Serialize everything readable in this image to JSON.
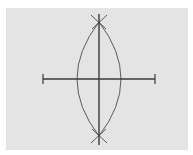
{
  "diagram": {
    "colors": {
      "background": "#ffffff",
      "panel": "#e4e4e4",
      "line": "#3a3a3a",
      "arc": "#5a5a5a"
    },
    "segment": {
      "x1": 43,
      "y1": 79,
      "x2": 155,
      "y2": 79
    },
    "bisector": {
      "x1": 99,
      "y1": 14,
      "x2": 99,
      "y2": 145
    },
    "arcs": {
      "left": "M 99 22 Q 55 79 99 136",
      "right": "M 99 22 Q 143 79 99 136"
    },
    "cross_marks": {
      "top": [
        {
          "x1": 91,
          "y1": 15,
          "x2": 106,
          "y2": 29
        },
        {
          "x1": 107,
          "y1": 15,
          "x2": 92,
          "y2": 29
        }
      ],
      "bottom": [
        {
          "x1": 91,
          "y1": 143,
          "x2": 106,
          "y2": 129
        },
        {
          "x1": 107,
          "y1": 143,
          "x2": 92,
          "y2": 129
        }
      ]
    }
  }
}
